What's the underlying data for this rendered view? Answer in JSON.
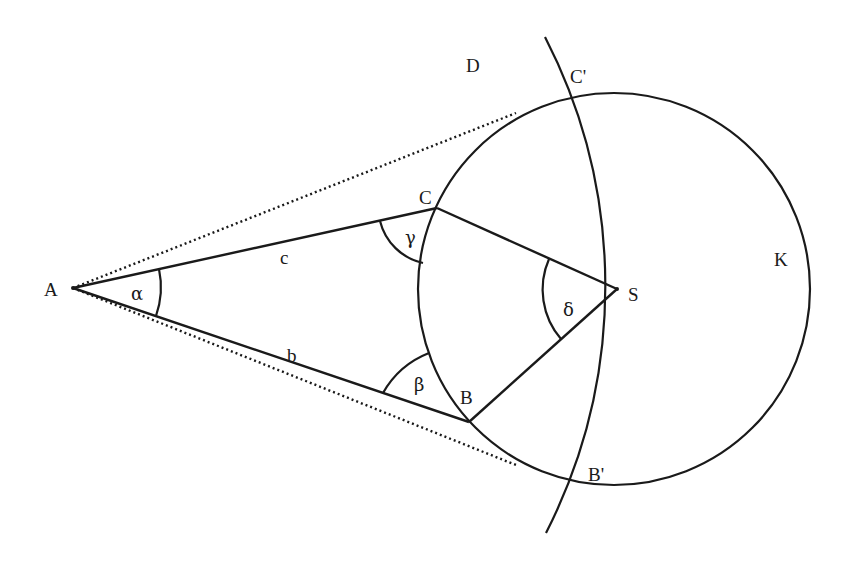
{
  "diagram": {
    "type": "geometry",
    "stroke_color": "#1a1a1a",
    "background": "#ffffff",
    "points": {
      "A": {
        "label": "A",
        "x": 73,
        "y": 288
      },
      "B": {
        "label": "B",
        "x": 469,
        "y": 422
      },
      "C": {
        "label": "C",
        "x": 437,
        "y": 208
      },
      "S": {
        "label": "S",
        "x": 617,
        "y": 289
      },
      "B_prime": {
        "label": "B'",
        "x": 577,
        "y": 487
      },
      "C_prime": {
        "label": "C'",
        "x": 577,
        "y": 93
      }
    },
    "region_labels": {
      "D": {
        "label": "D",
        "x": 488,
        "y": 68
      },
      "K": {
        "label": "K",
        "x": 776,
        "y": 265
      }
    },
    "side_labels": {
      "b": {
        "label": "b",
        "x": 291,
        "y": 360
      },
      "c": {
        "label": "c",
        "x": 285,
        "y": 262
      }
    },
    "angle_labels": {
      "alpha": {
        "label": "α",
        "x": 138,
        "y": 299
      },
      "beta": {
        "label": "β",
        "x": 418,
        "y": 389
      },
      "gamma": {
        "label": "γ",
        "x": 404,
        "y": 242
      },
      "delta": {
        "label": "δ",
        "x": 568,
        "y": 312
      }
    },
    "circle_K": {
      "cx": 614,
      "cy": 289,
      "r": 196
    },
    "arc_D": {
      "center": "A",
      "r": 544
    },
    "tangent_points": {
      "upper": {
        "x": 516,
        "y": 113
      },
      "lower": {
        "x": 516,
        "y": 465
      }
    }
  }
}
